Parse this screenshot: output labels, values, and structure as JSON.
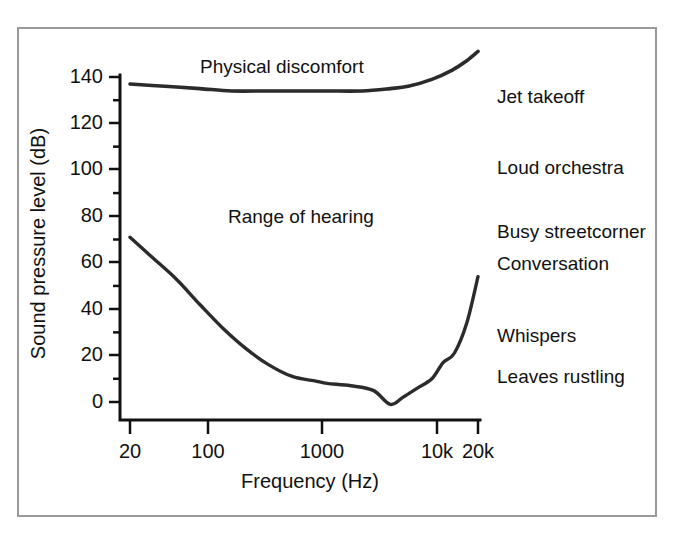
{
  "figure": {
    "frame_color": "#9a9a9a",
    "background": "#ffffff",
    "line_color": "#2b2b2b"
  },
  "chart_data": {
    "type": "line",
    "title": "",
    "xlabel": "Frequency (Hz)",
    "ylabel": "Sound pressure level (dB)",
    "xscale": "log",
    "xlim": [
      20,
      20000
    ],
    "ylim": [
      0,
      140
    ],
    "grid": false,
    "legend": "none",
    "xtick_labels": [
      "20",
      "100",
      "1000",
      "10k",
      "20k"
    ],
    "xtick_values": [
      20,
      100,
      1000,
      10000,
      20000
    ],
    "ytick_labels": [
      "0",
      "20",
      "40",
      "60",
      "80",
      "100",
      "120",
      "140"
    ],
    "ytick_values": [
      0,
      20,
      40,
      60,
      80,
      100,
      120,
      140
    ],
    "yminor_step": 10,
    "series": [
      {
        "name": "Physical discomfort (upper threshold)",
        "x": [
          20,
          40,
          80,
          150,
          300,
          600,
          1000,
          2000,
          3500,
          5000,
          8000,
          12000,
          16000,
          20000
        ],
        "values": [
          137,
          136,
          135,
          134,
          134,
          134,
          134,
          134,
          135,
          136,
          139,
          143,
          147,
          151
        ]
      },
      {
        "name": "Threshold of hearing (lower threshold)",
        "x": [
          20,
          30,
          50,
          80,
          125,
          200,
          315,
          500,
          800,
          1000,
          1600,
          2500,
          3500,
          4500,
          6000,
          8000,
          10000,
          12500,
          16000,
          20000
        ],
        "values": [
          71,
          63,
          53,
          42,
          32,
          23,
          16,
          11,
          9,
          8,
          7,
          5,
          -1,
          2,
          6,
          10,
          17,
          21,
          34,
          54
        ]
      }
    ],
    "annotations": [
      {
        "text": "Physical discomfort",
        "x_px": 200,
        "y_px": 66,
        "placement": "in-plot"
      },
      {
        "text": "Range of hearing",
        "x_px": 228,
        "y_px": 216,
        "placement": "in-plot"
      },
      {
        "text": "Jet takeoff",
        "x_px": 497,
        "y_px": 95,
        "db": 125,
        "placement": "right"
      },
      {
        "text": "Loud orchestra",
        "x_px": 497,
        "y_px": 166,
        "db": 100,
        "placement": "right"
      },
      {
        "text": "Busy streetcorner",
        "x_px": 497,
        "y_px": 230,
        "db": 78,
        "placement": "right"
      },
      {
        "text": "Conversation",
        "x_px": 497,
        "y_px": 262,
        "db": 66,
        "placement": "right"
      },
      {
        "text": "Whispers",
        "x_px": 497,
        "y_px": 334,
        "db": 26,
        "placement": "right"
      },
      {
        "text": "Leaves rustling",
        "x_px": 497,
        "y_px": 375,
        "db": 10,
        "placement": "right"
      }
    ]
  },
  "axis": {
    "y_title": "Sound pressure level (dB)",
    "x_title": "Frequency (Hz)",
    "y_ticks": [
      {
        "label": "140",
        "y": 77
      },
      {
        "label": "120",
        "y": 123
      },
      {
        "label": "100",
        "y": 169
      },
      {
        "label": "80",
        "y": 216
      },
      {
        "label": "60",
        "y": 262
      },
      {
        "label": "40",
        "y": 309
      },
      {
        "label": "20",
        "y": 355
      },
      {
        "label": "0",
        "y": 402
      }
    ],
    "x_ticks": [
      {
        "label": "20",
        "x": 130
      },
      {
        "label": "100",
        "x": 208
      },
      {
        "label": "1000",
        "x": 322
      },
      {
        "label": "10k",
        "x": 437
      },
      {
        "label": "20k",
        "x": 478
      }
    ]
  },
  "annotations_right": [
    "Jet takeoff",
    "Loud orchestra",
    "Busy streetcorner",
    "Conversation",
    "Whispers",
    "Leaves rustling"
  ],
  "annotations_plot": [
    "Physical discomfort",
    "Range of hearing"
  ]
}
